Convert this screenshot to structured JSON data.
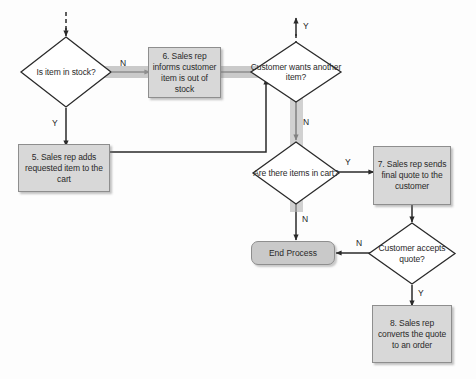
{
  "diagram": {
    "canvas": {
      "width": 476,
      "height": 379,
      "background": "#fdfdfd"
    },
    "colors": {
      "process_fill": "#d8d8d8",
      "terminator_fill": "#c9c9c9",
      "decision_fill": "#ffffff",
      "stroke": "#2a2a2a",
      "highlight_band": "#b6b6b6"
    },
    "nodes": [
      {
        "id": "d1",
        "type": "decision",
        "label": "Is item in stock?"
      },
      {
        "id": "b6",
        "type": "process",
        "label": "6. Sales rep informs customer item is out of stock"
      },
      {
        "id": "b5",
        "type": "process",
        "label": "5. Sales rep adds requested item to the cart"
      },
      {
        "id": "d2",
        "type": "decision",
        "label": "Customer wants another item?"
      },
      {
        "id": "d3",
        "type": "decision",
        "label": "Are there items in cart?"
      },
      {
        "id": "b7",
        "type": "process",
        "label": "7. Sales rep sends final quote to the customer"
      },
      {
        "id": "d4",
        "type": "decision",
        "label": "Customer accepts quote?"
      },
      {
        "id": "end",
        "type": "terminator",
        "label": "End Process"
      },
      {
        "id": "b8",
        "type": "process",
        "label": "8. Sales rep converts the quote to an order"
      }
    ],
    "edge_labels": {
      "d1_no": "N",
      "d1_yes": "Y",
      "d2_yes": "Y",
      "d2_no": "N",
      "d3_yes": "Y",
      "d3_no": "N",
      "d4_no": "N",
      "d4_yes": "Y"
    }
  }
}
